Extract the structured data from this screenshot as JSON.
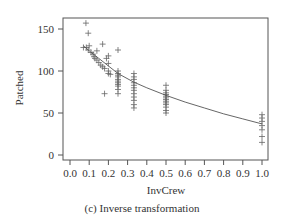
{
  "chart_data": {
    "type": "scatter",
    "title": "",
    "caption": "(c) Inverse transformation",
    "xlabel": "InvCrew",
    "ylabel": "Patched",
    "xlim": [
      -0.03,
      1.03
    ],
    "ylim": [
      -5,
      163
    ],
    "x_ticks": [
      "0.0",
      "0.1",
      "0.2",
      "0.3",
      "0.4",
      "0.5",
      "0.6",
      "0.7",
      "0.8",
      "0.9",
      "1.0"
    ],
    "y_ticks": [
      "0",
      "50",
      "100",
      "150"
    ],
    "grid": false,
    "legend": null,
    "marker": "+",
    "series": [
      {
        "name": "observations",
        "points": [
          [
            0.083,
            157
          ],
          [
            0.095,
            145
          ],
          [
            0.07,
            128
          ],
          [
            0.085,
            128
          ],
          [
            0.1,
            130
          ],
          [
            0.095,
            125
          ],
          [
            0.11,
            122
          ],
          [
            0.12,
            120
          ],
          [
            0.125,
            117
          ],
          [
            0.13,
            115
          ],
          [
            0.14,
            113
          ],
          [
            0.15,
            110
          ],
          [
            0.16,
            107
          ],
          [
            0.17,
            105
          ],
          [
            0.18,
            103
          ],
          [
            0.2,
            100
          ],
          [
            0.17,
            132
          ],
          [
            0.2,
            118
          ],
          [
            0.19,
            115
          ],
          [
            0.2,
            109
          ],
          [
            0.2,
            97
          ],
          [
            0.21,
            96
          ],
          [
            0.18,
            73
          ],
          [
            0.14,
            124
          ],
          [
            0.25,
            125
          ],
          [
            0.25,
            100
          ],
          [
            0.25,
            97
          ],
          [
            0.25,
            95
          ],
          [
            0.25,
            93
          ],
          [
            0.25,
            90
          ],
          [
            0.25,
            88
          ],
          [
            0.25,
            86
          ],
          [
            0.25,
            84
          ],
          [
            0.25,
            82
          ],
          [
            0.25,
            78
          ],
          [
            0.25,
            73
          ],
          [
            0.333,
            97
          ],
          [
            0.333,
            93
          ],
          [
            0.333,
            90
          ],
          [
            0.333,
            86
          ],
          [
            0.333,
            83
          ],
          [
            0.333,
            80
          ],
          [
            0.333,
            77
          ],
          [
            0.333,
            73
          ],
          [
            0.333,
            69
          ],
          [
            0.333,
            65
          ],
          [
            0.333,
            60
          ],
          [
            0.333,
            56
          ],
          [
            0.5,
            83
          ],
          [
            0.5,
            77
          ],
          [
            0.5,
            74
          ],
          [
            0.5,
            72
          ],
          [
            0.5,
            70
          ],
          [
            0.5,
            68
          ],
          [
            0.5,
            66
          ],
          [
            0.5,
            64
          ],
          [
            0.5,
            62
          ],
          [
            0.5,
            60
          ],
          [
            0.5,
            57
          ],
          [
            0.5,
            53
          ],
          [
            0.5,
            50
          ],
          [
            1.0,
            48
          ],
          [
            1.0,
            44
          ],
          [
            1.0,
            40
          ],
          [
            1.0,
            35
          ],
          [
            1.0,
            30
          ],
          [
            1.0,
            22
          ],
          [
            1.0,
            15
          ]
        ]
      },
      {
        "name": "fitted curve",
        "type": "line",
        "points": [
          [
            0.07,
            130
          ],
          [
            0.1,
            124
          ],
          [
            0.15,
            115
          ],
          [
            0.2,
            106
          ],
          [
            0.25,
            97
          ],
          [
            0.33,
            87
          ],
          [
            0.4,
            80
          ],
          [
            0.5,
            71
          ],
          [
            0.6,
            63
          ],
          [
            0.7,
            56
          ],
          [
            0.8,
            49
          ],
          [
            0.9,
            43
          ],
          [
            1.0,
            37
          ]
        ]
      }
    ]
  }
}
